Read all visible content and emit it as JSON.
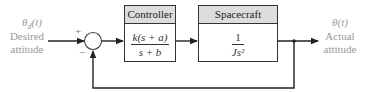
{
  "diagram": {
    "input": {
      "symbol": "θd(t)",
      "symbol_main": "θ",
      "symbol_sub": "d",
      "symbol_arg": "(t)",
      "label_line1": "Desired",
      "label_line2": "attitude"
    },
    "output": {
      "symbol": "θ(t)",
      "label_line1": "Actual",
      "label_line2": "attitude"
    },
    "summing_junction": {
      "plus": "+",
      "minus": "−"
    },
    "blocks": [
      {
        "title": "Controller",
        "numerator": "k(s + a)",
        "denominator": "s + b"
      },
      {
        "title": "Spacecraft",
        "numerator": "1",
        "denominator": "Js²"
      }
    ],
    "feedback": "unity negative feedback"
  }
}
